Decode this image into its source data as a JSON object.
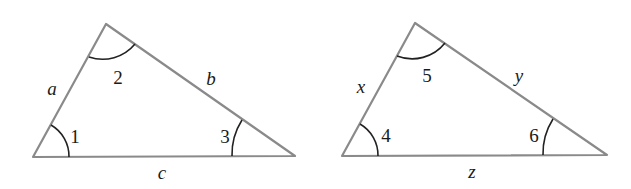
{
  "diagram": {
    "colors": {
      "side_stroke": "#8a8a8a",
      "arc_stroke": "#222222",
      "text": "#1a1a1a",
      "background": "#ffffff"
    },
    "triangles": [
      {
        "id": "left",
        "vertices": {
          "bottom_left": [
            33,
            157
          ],
          "top": [
            106,
            24
          ],
          "bottom_right": [
            295,
            156
          ]
        },
        "sides": [
          {
            "label": "a",
            "between": "bottom_left-top",
            "pos": [
              52,
              88
            ]
          },
          {
            "label": "b",
            "between": "top-bottom_right",
            "pos": [
              211,
              78
            ]
          },
          {
            "label": "c",
            "between": "bottom_left-bottom_right",
            "pos": [
              162,
              173
            ]
          }
        ],
        "angles": [
          {
            "label": "1",
            "vertex": "bottom_left",
            "pos": [
              75,
              136
            ]
          },
          {
            "label": "2",
            "vertex": "top",
            "pos": [
              118,
              78
            ]
          },
          {
            "label": "3",
            "vertex": "bottom_right",
            "pos": [
              225,
              136
            ]
          }
        ]
      },
      {
        "id": "right",
        "vertices": {
          "bottom_left": [
            342,
            156
          ],
          "top": [
            415,
            23
          ],
          "bottom_right": [
            607,
            155
          ]
        },
        "sides": [
          {
            "label": "x",
            "between": "bottom_left-top",
            "pos": [
              361,
              87
            ]
          },
          {
            "label": "y",
            "between": "top-bottom_right",
            "pos": [
              519,
              75
            ]
          },
          {
            "label": "z",
            "between": "bottom_left-bottom_right",
            "pos": [
              472,
              172
            ]
          }
        ],
        "angles": [
          {
            "label": "4",
            "vertex": "bottom_left",
            "pos": [
              386,
              136
            ]
          },
          {
            "label": "5",
            "vertex": "top",
            "pos": [
              427,
              76
            ]
          },
          {
            "label": "6",
            "vertex": "bottom_right",
            "pos": [
              535,
              135
            ]
          }
        ]
      }
    ]
  }
}
